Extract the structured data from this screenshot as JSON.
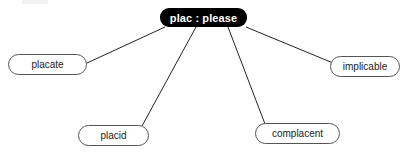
{
  "diagram": {
    "type": "word-root-mind-map",
    "background_color": "#ffffff",
    "edge_color": "#222222",
    "root": {
      "label": "plac : please",
      "name": "root-node-plac-please",
      "text_color": "#ffffff",
      "fill_color": "#000000",
      "box": {
        "x": 160,
        "y": 8,
        "w": 87,
        "h": 19
      }
    },
    "leaves": [
      {
        "label": "placate",
        "name": "leaf-node-placate",
        "box": {
          "x": 8,
          "y": 54,
          "w": 79,
          "h": 21
        },
        "anchor": {
          "x": 87,
          "y": 62
        },
        "root_anchor": {
          "x": 165,
          "y": 27
        }
      },
      {
        "label": "placid",
        "name": "leaf-node-placid",
        "box": {
          "x": 78,
          "y": 125,
          "w": 71,
          "h": 21
        },
        "anchor": {
          "x": 142,
          "y": 125
        },
        "root_anchor": {
          "x": 196,
          "y": 27
        }
      },
      {
        "label": "complacent",
        "name": "leaf-node-complacent",
        "box": {
          "x": 255,
          "y": 123,
          "w": 85,
          "h": 21
        },
        "anchor": {
          "x": 265,
          "y": 123
        },
        "root_anchor": {
          "x": 228,
          "y": 27
        }
      },
      {
        "label": "implicable",
        "name": "leaf-node-implicable",
        "box": {
          "x": 330,
          "y": 56,
          "w": 70,
          "h": 21
        },
        "anchor": {
          "x": 332,
          "y": 62
        },
        "root_anchor": {
          "x": 246,
          "y": 27
        }
      }
    ]
  }
}
